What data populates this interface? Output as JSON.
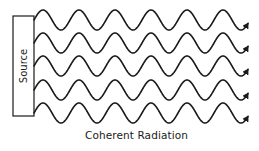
{
  "diagram": {
    "source_label": "Source",
    "caption": "Coherent Radiation",
    "colors": {
      "stroke": "#1a1a1a",
      "background": "#ffffff"
    },
    "source_box": {
      "x": 13,
      "y": 16,
      "width": 21,
      "height": 100
    },
    "waves": {
      "count": 5,
      "start_x": 34,
      "end_x": 248,
      "midlines_y": [
        20,
        43,
        66,
        90,
        113
      ],
      "amplitude": 10,
      "period": 36,
      "arrowheads": true,
      "in_phase": true
    }
  }
}
